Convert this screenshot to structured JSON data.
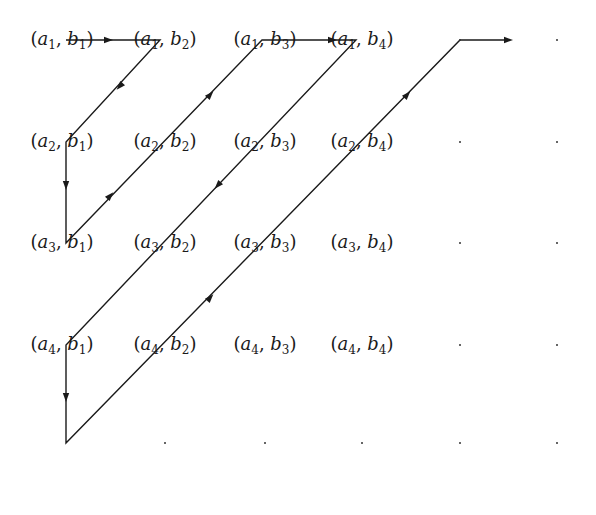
{
  "diagram": {
    "type": "cantor-pairing-enumeration",
    "rows": [
      "a1",
      "a2",
      "a3",
      "a4"
    ],
    "cols": [
      "b1",
      "b2",
      "b3",
      "b4"
    ],
    "cells": [
      [
        {
          "a": "1",
          "b": "1"
        },
        {
          "a": "1",
          "b": "2"
        },
        {
          "a": "1",
          "b": "3"
        },
        {
          "a": "1",
          "b": "4"
        }
      ],
      [
        {
          "a": "2",
          "b": "1"
        },
        {
          "a": "2",
          "b": "2"
        },
        {
          "a": "2",
          "b": "3"
        },
        {
          "a": "2",
          "b": "4"
        }
      ],
      [
        {
          "a": "3",
          "b": "1"
        },
        {
          "a": "3",
          "b": "2"
        },
        {
          "a": "3",
          "b": "3"
        },
        {
          "a": "3",
          "b": "4"
        }
      ],
      [
        {
          "a": "4",
          "b": "1"
        },
        {
          "a": "4",
          "b": "2"
        },
        {
          "a": "4",
          "b": "3"
        },
        {
          "a": "4",
          "b": "4"
        }
      ]
    ],
    "col_x": [
      62,
      165,
      265,
      362,
      460,
      557
    ],
    "row_y": [
      40,
      142,
      243,
      345,
      443
    ],
    "ellipsis_dots": [
      [
        460,
        40
      ],
      [
        557,
        40
      ],
      [
        460,
        142
      ],
      [
        557,
        142
      ],
      [
        460,
        243
      ],
      [
        557,
        243
      ],
      [
        460,
        345
      ],
      [
        557,
        345
      ],
      [
        165,
        443
      ],
      [
        265,
        443
      ],
      [
        362,
        443
      ],
      [
        460,
        443
      ],
      [
        557,
        443
      ]
    ],
    "path_points": [
      [
        66,
        40
      ],
      [
        160,
        40
      ],
      [
        66,
        142
      ],
      [
        66,
        243
      ],
      [
        262,
        40
      ],
      [
        356,
        40
      ],
      [
        66,
        345
      ],
      [
        66,
        443
      ],
      [
        460,
        40
      ],
      [
        508,
        40
      ]
    ],
    "arrows": [
      {
        "x": 108,
        "y": 40,
        "dir": "right"
      },
      {
        "x": 120,
        "y": 86,
        "dir": "down-left"
      },
      {
        "x": 66,
        "y": 185,
        "dir": "down"
      },
      {
        "x": 110,
        "y": 196,
        "dir": "up-right"
      },
      {
        "x": 210,
        "y": 95,
        "dir": "up-right"
      },
      {
        "x": 332,
        "y": 40,
        "dir": "right"
      },
      {
        "x": 218,
        "y": 185,
        "dir": "down-left"
      },
      {
        "x": 66,
        "y": 397,
        "dir": "down"
      },
      {
        "x": 210,
        "y": 298,
        "dir": "up-right"
      },
      {
        "x": 407,
        "y": 95,
        "dir": "up-right"
      },
      {
        "x": 508,
        "y": 40,
        "dir": "right"
      }
    ],
    "line_color": "#1a1a1a"
  }
}
